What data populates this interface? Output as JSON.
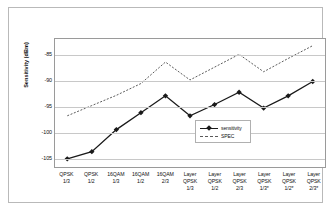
{
  "chart_data": {
    "type": "line",
    "title": "",
    "xlabel": "",
    "ylabel": "Sensitivity (dBm)",
    "ylim": [
      -107,
      -82
    ],
    "yticks": [
      -85,
      -90,
      -95,
      -100,
      -105
    ],
    "grid": true,
    "legend_position": "inside-center-right",
    "categories": [
      "QPSK 1/3",
      "QPSK 1/2",
      "16QAM 1/3",
      "16QAM 1/2",
      "16QAM 2/3",
      "Layer QPSK 1/3",
      "Layer QPSK 1/2",
      "Layer QPSK 2/3",
      "Layer QPSK 1/3*",
      "Layer QPSK 1/2*",
      "Layer QPSK 2/3*"
    ],
    "category_lines": [
      [
        "QPSK",
        "1/3"
      ],
      [
        "QPSK",
        "1/2"
      ],
      [
        "16QAM",
        "1/3"
      ],
      [
        "16QAM",
        "1/2"
      ],
      [
        "16QAM",
        "2/3"
      ],
      [
        "Layer",
        "QPSK",
        "1/3"
      ],
      [
        "Layer",
        "QPSK",
        "1/2"
      ],
      [
        "Layer",
        "QPSK",
        "2/3"
      ],
      [
        "Layer",
        "QPSK",
        "1/3*"
      ],
      [
        "Layer",
        "QPSK",
        "1/2*"
      ],
      [
        "Layer",
        "QPSK",
        "2/3*"
      ]
    ],
    "series": [
      {
        "name": "sensitivity",
        "style": "solid-with-markers",
        "color": "#1a1a1a",
        "values": [
          -105.4,
          -104.0,
          -99.7,
          -96.4,
          -93.1,
          -97.0,
          -94.8,
          -92.4,
          -95.5,
          -93.1,
          -90.3
        ]
      },
      {
        "name": "SPEC",
        "style": "dotted",
        "color": "#5a5a5a",
        "values": [
          -97.0,
          -95.0,
          -93.0,
          -90.7,
          -86.5,
          -90.0,
          -87.5,
          -85.0,
          -88.4,
          -85.8,
          -83.3
        ]
      }
    ]
  },
  "legend": {
    "entries": [
      {
        "label": "sensitivity"
      },
      {
        "label": "SPEC"
      }
    ]
  }
}
